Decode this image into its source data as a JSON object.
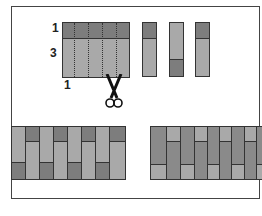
{
  "labels": {
    "top": "1",
    "middle": "3",
    "bottom": "1"
  },
  "colors": {
    "dark": "#7d7d7d",
    "light": "#a9a9a9",
    "mid": "#8e8e8e",
    "border": "#333333"
  },
  "main_rect": {
    "dark_ratio": 1,
    "light_ratio": 3,
    "cut_lines": 4
  },
  "strips": [
    {
      "order": [
        "dark",
        "light"
      ],
      "split": 0.28
    },
    {
      "order": [
        "light",
        "dark"
      ],
      "split": 0.72
    },
    {
      "order": [
        "dark",
        "light"
      ],
      "split": 0.28
    }
  ],
  "scissors_icon": "scissors",
  "bands": [
    {
      "name": "alternating",
      "columns": 8
    },
    {
      "name": "offset",
      "columns": 9
    }
  ]
}
